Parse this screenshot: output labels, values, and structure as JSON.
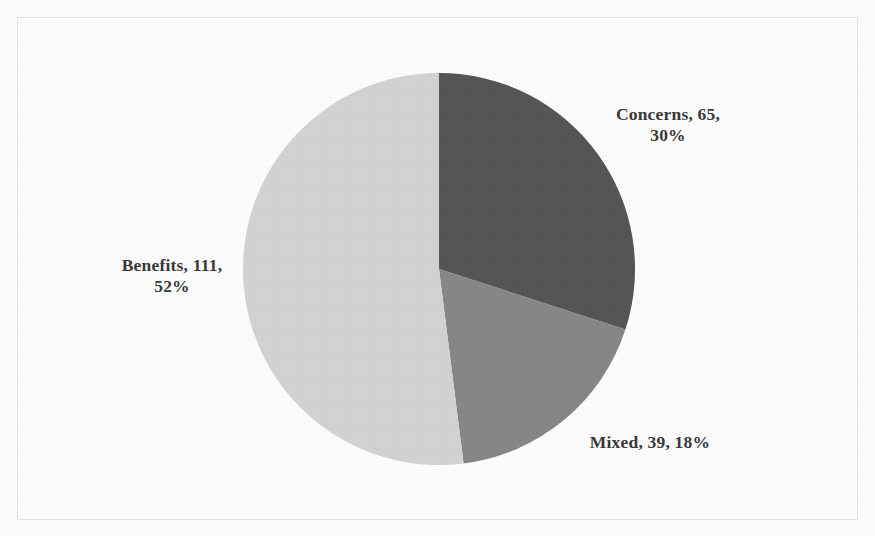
{
  "chart_data": {
    "type": "pie",
    "title": "",
    "subtitle": "",
    "xlabel": "",
    "ylabel": "",
    "legend_position": "none",
    "grid": false,
    "total": 215,
    "label_format": "name, value, percent",
    "categories": [
      "Concerns",
      "Mixed",
      "Benefits"
    ],
    "values": [
      65,
      39,
      111
    ],
    "percents": [
      30,
      18,
      52
    ],
    "colors": [
      "#565656",
      "#888888",
      "#d4d4d4"
    ],
    "start_angle_deg": 0,
    "direction": "clockwise",
    "slices": [
      {
        "name": "Concerns",
        "value": 65,
        "percent": 30,
        "color": "#565656",
        "label": "Concerns, 65, 30%",
        "label_line1": "Concerns, 65,",
        "label_line2": "30%",
        "label_position": "right-top"
      },
      {
        "name": "Mixed",
        "value": 39,
        "percent": 18,
        "color": "#888888",
        "label": "Mixed, 39, 18%",
        "label_line1": "Mixed, 39, 18%",
        "label_line2": "",
        "label_position": "right-bottom"
      },
      {
        "name": "Benefits",
        "value": 111,
        "percent": 52,
        "color": "#d4d4d4",
        "label": "Benefits, 111, 52%",
        "label_line1": "Benefits, 111,",
        "label_line2": "52%",
        "label_position": "left-middle"
      }
    ]
  },
  "figure": {
    "background_color": "#fefefe",
    "border_color": "#e3e3e3",
    "label_text_color": "#3a3a3a"
  }
}
